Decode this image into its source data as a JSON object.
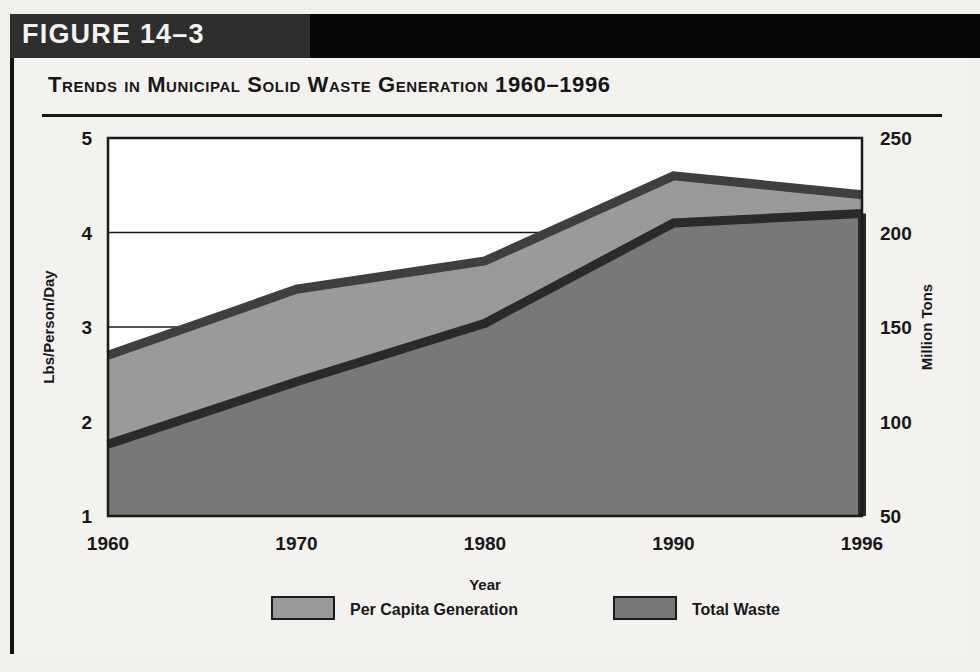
{
  "banner": {
    "figure_label": "FIGURE 14–3",
    "bar_left_color": "#2e2e2e",
    "bar_right_color": "#070707"
  },
  "card": {
    "title": "Trends in Municipal Solid Waste Generation 1960–1996",
    "background": "#f4f2ef",
    "rule_color": "#17171a"
  },
  "chart_data": {
    "type": "area",
    "title": "Trends in Municipal Solid Waste Generation 1960–1996",
    "xlabel": "Year",
    "ylabel": "Lbs/Person/Day",
    "y2label": "Million Tons",
    "categories": [
      "1960",
      "1970",
      "1980",
      "1990",
      "1996"
    ],
    "x": [
      1960,
      1970,
      1980,
      1990,
      1996
    ],
    "xtick_labels": [
      "1960",
      "1970",
      "1980",
      "1990",
      "1996"
    ],
    "ylim": [
      1,
      5
    ],
    "ytick_labels": [
      "1",
      "2",
      "3",
      "4",
      "5"
    ],
    "yticks": [
      1,
      2,
      3,
      4,
      5
    ],
    "y2lim": [
      50,
      250
    ],
    "y2tick_labels": [
      "50",
      "100",
      "150",
      "200",
      "250"
    ],
    "y2ticks": [
      50,
      100,
      150,
      200,
      250
    ],
    "grid": true,
    "legend_position": "bottom",
    "series": [
      {
        "name": "Per Capita Generation",
        "axis": "left",
        "units": "Lbs/Person/Day",
        "color": "#9a9a9a",
        "line_color": "#3f3f3f",
        "values": [
          2.7,
          3.4,
          3.7,
          4.6,
          4.4
        ]
      },
      {
        "name": "Total Waste",
        "axis": "right",
        "units": "Million Tons",
        "color": "#787878",
        "line_color": "#2a2a2a",
        "values": [
          88,
          121,
          152,
          205,
          210
        ]
      }
    ]
  },
  "legend": {
    "items": [
      {
        "label": "Per Capita Generation",
        "swatch_color": "#9a9a9a"
      },
      {
        "label": "Total Waste",
        "swatch_color": "#787878"
      }
    ]
  }
}
